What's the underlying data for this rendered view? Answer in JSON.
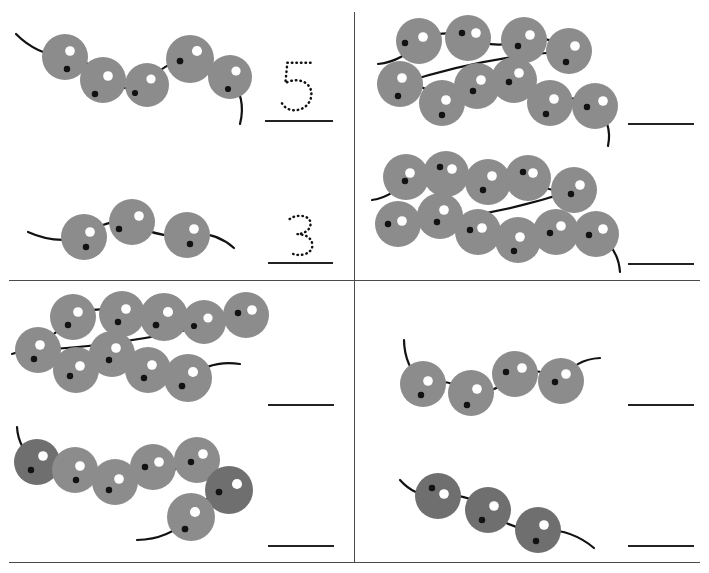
{
  "worksheet": {
    "title": "Counting Caterpillars Worksheet",
    "type": "count-the-beads",
    "page_width": 709,
    "page_height": 573,
    "background_color": "#ffffff",
    "bead_color": "#8c8c8c",
    "bead_dark_color": "#6f6f6f",
    "highlight_color": "#ffffff",
    "dot_color": "#121212",
    "line_color": "#222222",
    "divider_color": "#4a4a4a"
  },
  "dividers": {
    "vertical": {
      "x": 354,
      "y": 12,
      "height": 550
    },
    "horizontal": {
      "x": 9,
      "y": 280,
      "width": 691
    },
    "bottom": {
      "x": 9,
      "y": 562,
      "width": 691
    }
  },
  "quadrants": [
    {
      "id": "top-left",
      "name": "quadrant-top-left",
      "problems": [
        {
          "id": "q1-p1",
          "name": "problem-1",
          "bead_count": 5,
          "answer_value": "5",
          "answer_shown_as": "dotted-numeral",
          "answer_line": {
            "x": 265,
            "y": 120,
            "width": 68
          }
        },
        {
          "id": "q1-p2",
          "name": "problem-2",
          "bead_count": 3,
          "answer_value": "3",
          "answer_shown_as": "dotted-numeral",
          "answer_line": {
            "x": 268,
            "y": 262,
            "width": 65
          }
        }
      ]
    },
    {
      "id": "top-right",
      "name": "quadrant-top-right",
      "problems": [
        {
          "id": "q2-p1",
          "name": "problem-3",
          "bead_count": 10,
          "answer_value": "",
          "answer_shown_as": "blank-line",
          "answer_line": {
            "x": 628,
            "y": 123,
            "width": 66
          }
        },
        {
          "id": "q2-p2",
          "name": "problem-4",
          "bead_count": 11,
          "answer_value": "",
          "answer_shown_as": "blank-line",
          "answer_line": {
            "x": 628,
            "y": 263,
            "width": 66
          }
        }
      ]
    },
    {
      "id": "bottom-left",
      "name": "quadrant-bottom-left",
      "problems": [
        {
          "id": "q3-p1",
          "name": "problem-5",
          "bead_count": 9,
          "answer_value": "",
          "answer_shown_as": "blank-line",
          "answer_line": {
            "x": 268,
            "y": 404,
            "width": 66
          }
        },
        {
          "id": "q3-p2",
          "name": "problem-6",
          "bead_count": 7,
          "answer_value": "",
          "answer_shown_as": "blank-line",
          "answer_line": {
            "x": 268,
            "y": 545,
            "width": 66
          }
        }
      ]
    },
    {
      "id": "bottom-right",
      "name": "quadrant-bottom-right",
      "problems": [
        {
          "id": "q4-p1",
          "name": "problem-7",
          "bead_count": 4,
          "answer_value": "",
          "answer_shown_as": "blank-line",
          "answer_line": {
            "x": 628,
            "y": 404,
            "width": 66
          }
        },
        {
          "id": "q4-p2",
          "name": "problem-8",
          "bead_count": 3,
          "answer_value": "",
          "answer_shown_as": "blank-line",
          "answer_line": {
            "x": 628,
            "y": 545,
            "width": 66
          }
        }
      ]
    }
  ],
  "caterpillars": {
    "q1-p1": {
      "viewbox": "0 0 250 115",
      "left": 8,
      "top": 12,
      "width": 250,
      "height": 115,
      "tail_start": {
        "x": 8,
        "y": 22
      },
      "tail_end": {
        "x": 232,
        "y": 112
      },
      "beads": [
        {
          "cx": 57,
          "cy": 45,
          "r": 23,
          "hi": {
            "dx": 5,
            "dy": -6
          },
          "dot": {
            "dx": 2,
            "dy": 12
          },
          "shade": "light"
        },
        {
          "cx": 95,
          "cy": 68,
          "r": 23,
          "hi": {
            "dx": 5,
            "dy": -4
          },
          "dot": {
            "dx": -8,
            "dy": 14
          },
          "shade": "light"
        },
        {
          "cx": 139,
          "cy": 73,
          "r": 22,
          "hi": {
            "dx": 4,
            "dy": -6
          },
          "dot": {
            "dx": -12,
            "dy": 8
          },
          "shade": "light"
        },
        {
          "cx": 182,
          "cy": 47,
          "r": 24,
          "hi": {
            "dx": 7,
            "dy": -8
          },
          "dot": {
            "dx": -10,
            "dy": 2
          },
          "shade": "light"
        },
        {
          "cx": 222,
          "cy": 65,
          "r": 22,
          "hi": {
            "dx": 6,
            "dy": -6
          },
          "dot": {
            "dx": -2,
            "dy": 12
          },
          "shade": "light"
        }
      ]
    },
    "q1-p2": {
      "viewbox": "0 0 220 80",
      "left": 22,
      "top": 192,
      "width": 220,
      "height": 80,
      "tail_start": {
        "x": 6,
        "y": 40
      },
      "tail_end": {
        "x": 212,
        "y": 56
      },
      "beads": [
        {
          "cx": 62,
          "cy": 45,
          "r": 23,
          "hi": {
            "dx": 6,
            "dy": -5
          },
          "dot": {
            "dx": 2,
            "dy": 10
          },
          "shade": "light"
        },
        {
          "cx": 110,
          "cy": 30,
          "r": 23,
          "hi": {
            "dx": 7,
            "dy": -6
          },
          "dot": {
            "dx": -13,
            "dy": 7
          },
          "shade": "light"
        },
        {
          "cx": 165,
          "cy": 43,
          "r": 23,
          "hi": {
            "dx": 7,
            "dy": -6
          },
          "dot": {
            "dx": 3,
            "dy": 9
          },
          "shade": "light"
        }
      ]
    },
    "q2-p1": {
      "viewbox": "0 0 270 135",
      "left": 372,
      "top": 18,
      "width": 270,
      "height": 135,
      "tail_start": {
        "x": 6,
        "y": 46
      },
      "tail_end": {
        "x": 236,
        "y": 128
      },
      "beads": [
        {
          "cx": 47,
          "cy": 23,
          "r": 23,
          "hi": {
            "dx": 4,
            "dy": -4
          },
          "dot": {
            "dx": -14,
            "dy": 2
          },
          "shade": "light"
        },
        {
          "cx": 96,
          "cy": 20,
          "r": 23,
          "hi": {
            "dx": 8,
            "dy": -5
          },
          "dot": {
            "dx": -6,
            "dy": -5
          },
          "shade": "light"
        },
        {
          "cx": 152,
          "cy": 22,
          "r": 23,
          "hi": {
            "dx": 6,
            "dy": -5
          },
          "dot": {
            "dx": -6,
            "dy": 6
          },
          "shade": "light"
        },
        {
          "cx": 197,
          "cy": 33,
          "r": 23,
          "hi": {
            "dx": 6,
            "dy": -5
          },
          "dot": {
            "dx": -3,
            "dy": 11
          },
          "shade": "light"
        },
        {
          "cx": 28,
          "cy": 66,
          "r": 23,
          "hi": {
            "dx": 2,
            "dy": -6
          },
          "dot": {
            "dx": -2,
            "dy": 12
          },
          "shade": "light"
        },
        {
          "cx": 70,
          "cy": 85,
          "r": 23,
          "hi": {
            "dx": 4,
            "dy": -3
          },
          "dot": {
            "dx": 0,
            "dy": 12
          },
          "shade": "light"
        },
        {
          "cx": 105,
          "cy": 68,
          "r": 23,
          "hi": {
            "dx": 4,
            "dy": -6
          },
          "dot": {
            "dx": -4,
            "dy": 5
          },
          "shade": "light"
        },
        {
          "cx": 142,
          "cy": 62,
          "r": 23,
          "hi": {
            "dx": 5,
            "dy": -7
          },
          "dot": {
            "dx": -5,
            "dy": 2
          },
          "shade": "light"
        },
        {
          "cx": 178,
          "cy": 85,
          "r": 23,
          "hi": {
            "dx": 4,
            "dy": -4
          },
          "dot": {
            "dx": -4,
            "dy": 11
          },
          "shade": "light"
        },
        {
          "cx": 223,
          "cy": 88,
          "r": 23,
          "hi": {
            "dx": 8,
            "dy": -5
          },
          "dot": {
            "dx": -8,
            "dy": 1
          },
          "shade": "light"
        }
      ]
    },
    "q2-p2": {
      "viewbox": "0 0 280 125",
      "left": 368,
      "top": 152,
      "width": 280,
      "height": 125,
      "tail_start": {
        "x": 4,
        "y": 48
      },
      "tail_end": {
        "x": 252,
        "y": 120
      },
      "beads": [
        {
          "cx": 38,
          "cy": 25,
          "r": 23,
          "hi": {
            "dx": 4,
            "dy": -4
          },
          "dot": {
            "dx": -1,
            "dy": 4
          },
          "shade": "light"
        },
        {
          "cx": 78,
          "cy": 22,
          "r": 23,
          "hi": {
            "dx": 6,
            "dy": -5
          },
          "dot": {
            "dx": -6,
            "dy": -7
          },
          "shade": "light"
        },
        {
          "cx": 120,
          "cy": 30,
          "r": 23,
          "hi": {
            "dx": 4,
            "dy": -6
          },
          "dot": {
            "dx": -5,
            "dy": 8
          },
          "shade": "light"
        },
        {
          "cx": 160,
          "cy": 26,
          "r": 23,
          "hi": {
            "dx": 5,
            "dy": -5
          },
          "dot": {
            "dx": -5,
            "dy": -6
          },
          "shade": "light"
        },
        {
          "cx": 206,
          "cy": 38,
          "r": 23,
          "hi": {
            "dx": 6,
            "dy": -5
          },
          "dot": {
            "dx": -3,
            "dy": 4
          },
          "shade": "light"
        },
        {
          "cx": 30,
          "cy": 72,
          "r": 23,
          "hi": {
            "dx": 4,
            "dy": -3
          },
          "dot": {
            "dx": -10,
            "dy": 0
          },
          "shade": "light"
        },
        {
          "cx": 72,
          "cy": 64,
          "r": 23,
          "hi": {
            "dx": 4,
            "dy": -6
          },
          "dot": {
            "dx": -3,
            "dy": 6
          },
          "shade": "light"
        },
        {
          "cx": 110,
          "cy": 80,
          "r": 23,
          "hi": {
            "dx": 4,
            "dy": -4
          },
          "dot": {
            "dx": -8,
            "dy": -2
          },
          "shade": "light"
        },
        {
          "cx": 150,
          "cy": 88,
          "r": 23,
          "hi": {
            "dx": 2,
            "dy": -3
          },
          "dot": {
            "dx": -4,
            "dy": 11
          },
          "shade": "light"
        },
        {
          "cx": 188,
          "cy": 80,
          "r": 23,
          "hi": {
            "dx": 5,
            "dy": -6
          },
          "dot": {
            "dx": -6,
            "dy": 1
          },
          "shade": "light"
        },
        {
          "cx": 228,
          "cy": 82,
          "r": 23,
          "hi": {
            "dx": 7,
            "dy": -5
          },
          "dot": {
            "dx": -7,
            "dy": 1
          },
          "shade": "light"
        }
      ]
    },
    "q3-p1": {
      "viewbox": "0 0 270 120",
      "left": 8,
      "top": 292,
      "width": 270,
      "height": 120,
      "tail_start": {
        "x": 4,
        "y": 62
      },
      "tail_end": {
        "x": 232,
        "y": 72
      },
      "beads": [
        {
          "cx": 65,
          "cy": 25,
          "r": 23,
          "hi": {
            "dx": 5,
            "dy": -5
          },
          "dot": {
            "dx": -5,
            "dy": 8
          },
          "shade": "light"
        },
        {
          "cx": 114,
          "cy": 22,
          "r": 23,
          "hi": {
            "dx": 4,
            "dy": -5
          },
          "dot": {
            "dx": -4,
            "dy": 8
          },
          "shade": "light"
        },
        {
          "cx": 156,
          "cy": 25,
          "r": 24,
          "hi": {
            "dx": 4,
            "dy": -5
          },
          "dot": {
            "dx": -8,
            "dy": 8
          },
          "shade": "light"
        },
        {
          "cx": 196,
          "cy": 30,
          "r": 22,
          "hi": {
            "dx": 4,
            "dy": -4
          },
          "dot": {
            "dx": -10,
            "dy": 4
          },
          "shade": "light"
        },
        {
          "cx": 238,
          "cy": 23,
          "r": 23,
          "hi": {
            "dx": 6,
            "dy": -5
          },
          "dot": {
            "dx": -8,
            "dy": -2
          },
          "shade": "light"
        },
        {
          "cx": 30,
          "cy": 58,
          "r": 23,
          "hi": {
            "dx": 2,
            "dy": -5
          },
          "dot": {
            "dx": -4,
            "dy": 9
          },
          "shade": "light"
        },
        {
          "cx": 68,
          "cy": 78,
          "r": 23,
          "hi": {
            "dx": 4,
            "dy": -4
          },
          "dot": {
            "dx": -6,
            "dy": 6
          },
          "shade": "light"
        },
        {
          "cx": 104,
          "cy": 62,
          "r": 23,
          "hi": {
            "dx": 4,
            "dy": -6
          },
          "dot": {
            "dx": -3,
            "dy": 6
          },
          "shade": "light"
        },
        {
          "cx": 140,
          "cy": 78,
          "r": 23,
          "hi": {
            "dx": 4,
            "dy": -5
          },
          "dot": {
            "dx": -4,
            "dy": 8
          },
          "shade": "light"
        },
        {
          "cx": 180,
          "cy": 86,
          "r": 24,
          "hi": {
            "dx": 5,
            "dy": -6
          },
          "dot": {
            "dx": -6,
            "dy": 8
          },
          "shade": "light"
        }
      ]
    },
    "q3-p2": {
      "viewbox": "0 0 260 125",
      "left": 5,
      "top": 422,
      "width": 260,
      "height": 125,
      "tail_start": {
        "x": 12,
        "y": 5
      },
      "tail_end": {
        "x": 132,
        "y": 118
      },
      "beads": [
        {
          "cx": 32,
          "cy": 40,
          "r": 23,
          "hi": {
            "dx": 6,
            "dy": -6
          },
          "dot": {
            "dx": -6,
            "dy": 8
          },
          "shade": "dark"
        },
        {
          "cx": 70,
          "cy": 48,
          "r": 23,
          "hi": {
            "dx": 5,
            "dy": -4
          },
          "dot": {
            "dx": 1,
            "dy": 10
          },
          "shade": "light"
        },
        {
          "cx": 110,
          "cy": 60,
          "r": 23,
          "hi": {
            "dx": 4,
            "dy": -3
          },
          "dot": {
            "dx": -6,
            "dy": 8
          },
          "shade": "light"
        },
        {
          "cx": 148,
          "cy": 45,
          "r": 23,
          "hi": {
            "dx": 6,
            "dy": -5
          },
          "dot": {
            "dx": -8,
            "dy": 0
          },
          "shade": "light"
        },
        {
          "cx": 192,
          "cy": 38,
          "r": 23,
          "hi": {
            "dx": 6,
            "dy": -6
          },
          "dot": {
            "dx": -6,
            "dy": 2
          },
          "shade": "light"
        },
        {
          "cx": 224,
          "cy": 68,
          "r": 24,
          "hi": {
            "dx": 8,
            "dy": -6
          },
          "dot": {
            "dx": -10,
            "dy": 2
          },
          "shade": "dark"
        },
        {
          "cx": 186,
          "cy": 95,
          "r": 24,
          "hi": {
            "dx": 4,
            "dy": -5
          },
          "dot": {
            "dx": -6,
            "dy": 12
          },
          "shade": "light"
        }
      ]
    },
    "q4-p1": {
      "viewbox": "0 0 230 90",
      "left": 388,
      "top": 336,
      "width": 230,
      "height": 90,
      "tail_start": {
        "x": 16,
        "y": 4
      },
      "tail_end": {
        "x": 212,
        "y": 22
      },
      "beads": [
        {
          "cx": 35,
          "cy": 48,
          "r": 23,
          "hi": {
            "dx": 5,
            "dy": -3
          },
          "dot": {
            "dx": -2,
            "dy": 11
          },
          "shade": "light"
        },
        {
          "cx": 83,
          "cy": 57,
          "r": 23,
          "hi": {
            "dx": 6,
            "dy": -4
          },
          "dot": {
            "dx": -4,
            "dy": 12
          },
          "shade": "light"
        },
        {
          "cx": 127,
          "cy": 38,
          "r": 23,
          "hi": {
            "dx": 7,
            "dy": -6
          },
          "dot": {
            "dx": -9,
            "dy": -2
          },
          "shade": "light"
        },
        {
          "cx": 173,
          "cy": 45,
          "r": 23,
          "hi": {
            "dx": 5,
            "dy": -7
          },
          "dot": {
            "dx": -6,
            "dy": 1
          },
          "shade": "light"
        }
      ]
    },
    "q4-p2": {
      "viewbox": "0 0 210 95",
      "left": 398,
      "top": 468,
      "width": 210,
      "height": 95,
      "tail_start": {
        "x": 2,
        "y": 12
      },
      "tail_end": {
        "x": 196,
        "y": 80
      },
      "beads": [
        {
          "cx": 40,
          "cy": 28,
          "r": 23,
          "hi": {
            "dx": 6,
            "dy": -2
          },
          "dot": {
            "dx": -6,
            "dy": -8
          },
          "shade": "dark"
        },
        {
          "cx": 90,
          "cy": 42,
          "r": 23,
          "hi": {
            "dx": 6,
            "dy": -4
          },
          "dot": {
            "dx": -6,
            "dy": 10
          },
          "shade": "dark"
        },
        {
          "cx": 140,
          "cy": 62,
          "r": 23,
          "hi": {
            "dx": 6,
            "dy": -5
          },
          "dot": {
            "dx": -2,
            "dy": 11
          },
          "shade": "dark"
        }
      ]
    }
  },
  "numerals": [
    {
      "id": "numeral-5",
      "name": "dotted-numeral-five",
      "value": "5",
      "left": 274,
      "top": 58,
      "width": 46,
      "height": 58
    },
    {
      "id": "numeral-3",
      "name": "dotted-numeral-three",
      "value": "3",
      "left": 284,
      "top": 212,
      "width": 34,
      "height": 48
    }
  ]
}
